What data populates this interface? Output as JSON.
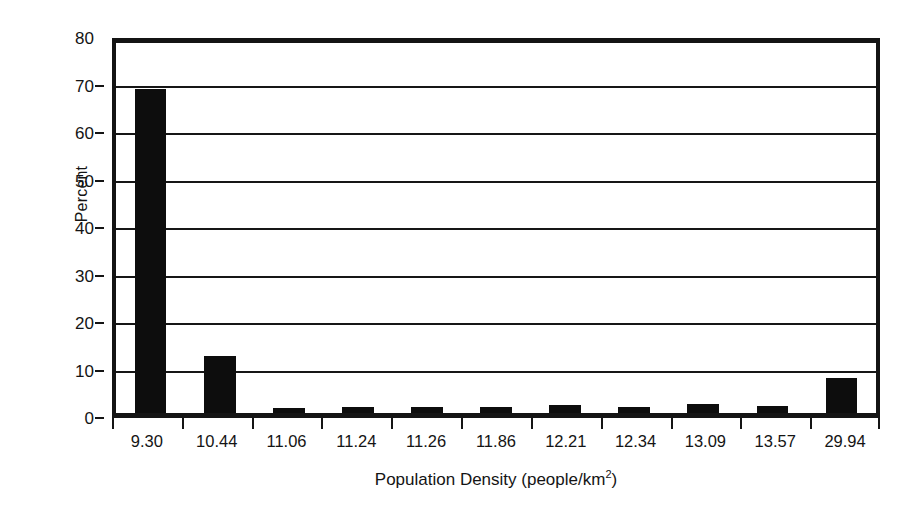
{
  "chart_data": {
    "type": "bar",
    "title": "",
    "xlabel": "Population Density (people/km2)",
    "xlabel_prefix": "Population Density (people/km",
    "xlabel_superscript": "2",
    "xlabel_suffix": ")",
    "ylabel": "Percent",
    "categories": [
      "9.30",
      "10.44",
      "11.06",
      "11.24",
      "11.26",
      "11.86",
      "12.21",
      "12.34",
      "13.09",
      "13.57",
      "29.94"
    ],
    "values": [
      70.0,
      12.3,
      1.1,
      1.3,
      1.3,
      1.3,
      1.7,
      1.2,
      1.9,
      1.5,
      7.6
    ],
    "ylim": [
      0,
      80
    ],
    "ytick_values": [
      0,
      10,
      20,
      30,
      40,
      50,
      60,
      70,
      80
    ],
    "ytick_labels": [
      "0",
      "10",
      "20",
      "30",
      "40",
      "50",
      "60",
      "70",
      "80"
    ],
    "ystep": 10,
    "grid": "horizontal",
    "legend": "none",
    "bar_color": "#0d0d0d",
    "axis_color": "#141414",
    "background_color": "#ffffff"
  }
}
